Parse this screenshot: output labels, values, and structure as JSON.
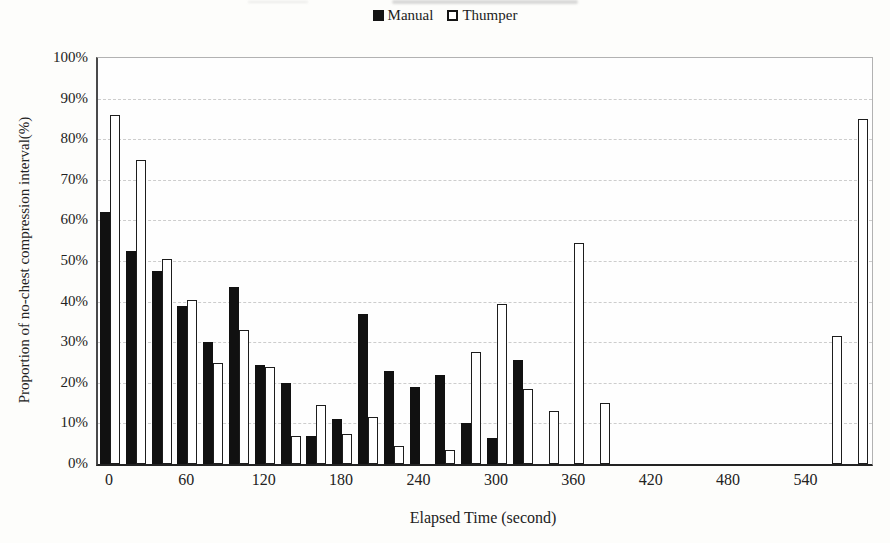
{
  "legend": {
    "items": [
      {
        "label": "Manual",
        "swatch": "filled-black-square"
      },
      {
        "label": "Thumper",
        "swatch": "outlined-white-square"
      }
    ]
  },
  "chart_data": {
    "type": "bar",
    "title": "",
    "xlabel": "Elapsed Time (second)",
    "ylabel": "Proportion of no-chest compression interval(%)",
    "x": [
      0,
      20,
      40,
      60,
      80,
      100,
      120,
      140,
      160,
      180,
      200,
      220,
      240,
      260,
      280,
      300,
      320,
      340,
      360,
      380,
      400,
      420,
      440,
      460,
      480,
      500,
      520,
      540,
      560,
      580
    ],
    "series": [
      {
        "name": "Manual",
        "fill": "#111111",
        "outline": "#111111",
        "values": [
          62,
          52.5,
          47.5,
          39,
          30,
          43.5,
          24.5,
          20,
          7,
          11,
          37,
          23,
          19,
          22,
          10,
          6.5,
          25.5,
          0,
          0,
          0,
          0,
          0,
          0,
          0,
          0,
          0,
          0,
          0,
          0,
          0
        ]
      },
      {
        "name": "Thumper",
        "fill": "#ffffff",
        "outline": "#1d1d1d",
        "values": [
          86,
          75,
          50.5,
          40.5,
          25,
          33,
          24,
          7,
          14.5,
          7.5,
          11.5,
          4.5,
          0,
          3.5,
          27.5,
          39.5,
          18.5,
          13,
          54.5,
          15,
          0,
          0,
          0,
          0,
          0,
          0,
          0,
          0,
          31.5,
          85
        ]
      }
    ],
    "ylim": [
      0,
      100
    ],
    "ytick_step": 10,
    "ytick_labels": [
      "0%",
      "10%",
      "20%",
      "30%",
      "40%",
      "50%",
      "60%",
      "70%",
      "80%",
      "90%",
      "100%"
    ],
    "xtick_labels": [
      "0",
      "60",
      "120",
      "180",
      "240",
      "300",
      "360",
      "420",
      "480",
      "540"
    ],
    "xtick_every_nth_bin": 3,
    "grid": "horizontal-dashed",
    "legend_position": "top-center"
  }
}
